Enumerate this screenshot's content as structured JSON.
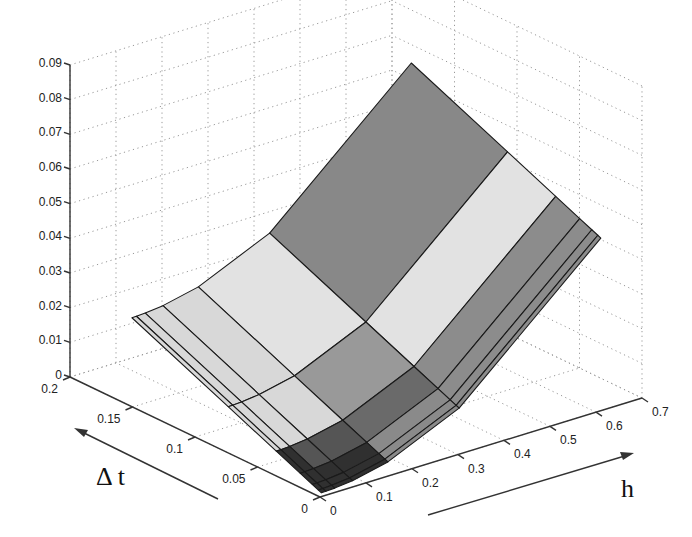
{
  "chart_data": {
    "type": "surface",
    "title": "",
    "xlabel": "h",
    "ylabel": "Δ t",
    "zlabel": "",
    "xlim": [
      0,
      0.7
    ],
    "ylim": [
      0,
      0.2
    ],
    "zlim": [
      0,
      0.09
    ],
    "x_ticks": [
      "0",
      "0.1",
      "0.2",
      "0.3",
      "0.4",
      "0.5",
      "0.6",
      "0.7"
    ],
    "y_ticks": [
      "0",
      "0.05",
      "0.1",
      "0.15",
      "0.2"
    ],
    "z_ticks": [
      "0",
      "0.01",
      "0.02",
      "0.03",
      "0.04",
      "0.05",
      "0.06",
      "0.07",
      "0.08",
      "0.09"
    ],
    "grid": true,
    "colormap": "gray",
    "mesh_h": [
      0.0096,
      0.0193,
      0.0386,
      0.0771,
      0.154,
      0.309,
      0.617
    ],
    "mesh_dt": [
      0.0024,
      0.0048,
      0.0096,
      0.0193,
      0.0385,
      0.077,
      0.154
    ],
    "surface_corners": {
      "h_min_dt_min": 0.0,
      "h_max_dt_min": 0.049,
      "h_min_dt_max": 0.025,
      "h_max_dt_max": 0.068
    },
    "model": "z ≈ 0.128·h² + 0.16·Δt"
  },
  "labels": {
    "h_axis_title": "h",
    "dt_axis_title": "Δ t"
  }
}
